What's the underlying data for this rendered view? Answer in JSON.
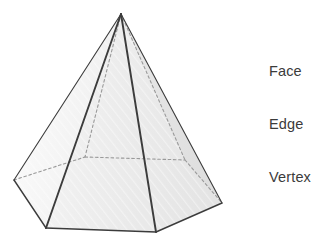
{
  "figure": {
    "title_alt": "Hexagonal pyramid geometry diagram",
    "shape_name": "hexagonal-pyramid",
    "stroke_color": "#3c3c3c",
    "hidden_stroke_color": "#9a9a9a",
    "background_color": "#ffffff",
    "apex": {
      "x": 121,
      "y": 14
    },
    "base_vertices": [
      {
        "name": "left",
        "x": 14,
        "y": 180,
        "hidden": false
      },
      {
        "name": "front-left",
        "x": 46,
        "y": 228,
        "hidden": false
      },
      {
        "name": "front-right",
        "x": 156,
        "y": 232,
        "hidden": false
      },
      {
        "name": "right",
        "x": 222,
        "y": 203,
        "hidden": false
      },
      {
        "name": "back-right",
        "x": 185,
        "y": 160,
        "hidden": true
      },
      {
        "name": "back-left",
        "x": 85,
        "y": 157,
        "hidden": true
      }
    ],
    "face_fills": [
      {
        "name": "face-far-left",
        "color": "#fbfbfb"
      },
      {
        "name": "face-left",
        "color": "#f2f2f2"
      },
      {
        "name": "face-front-left",
        "color": "#ededed"
      },
      {
        "name": "face-front-right",
        "color": "#e8e8e8"
      },
      {
        "name": "face-right",
        "color": "#e3e3e3"
      }
    ]
  },
  "labels": {
    "items": [
      {
        "text": "Face"
      },
      {
        "text": "Edge"
      },
      {
        "text": "Vertex"
      }
    ]
  }
}
